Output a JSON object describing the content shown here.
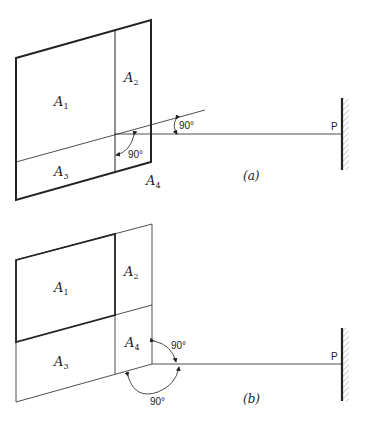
{
  "figure_a": {
    "caption": "(a)",
    "labels": {
      "A1": {
        "base": "A",
        "sub": "1"
      },
      "A2": {
        "base": "A",
        "sub": "2"
      },
      "A3": {
        "base": "A",
        "sub": "3"
      },
      "A4": {
        "base": "A",
        "sub": "4"
      }
    },
    "angles": [
      "90°",
      "90°"
    ],
    "point": "P"
  },
  "figure_b": {
    "caption": "(b)",
    "labels": {
      "A1": {
        "base": "A",
        "sub": "1"
      },
      "A2": {
        "base": "A",
        "sub": "2"
      },
      "A3": {
        "base": "A",
        "sub": "3"
      },
      "A4": {
        "base": "A",
        "sub": "4"
      }
    },
    "angles": [
      "90°",
      "90°"
    ],
    "point": "P"
  },
  "colors": {
    "line": "#222222",
    "hatch": "#888888",
    "background": "#ffffff"
  }
}
